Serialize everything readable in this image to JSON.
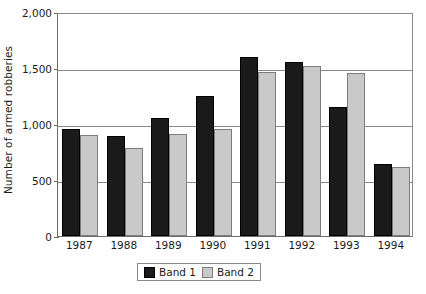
{
  "chart_data": {
    "type": "bar",
    "title": "",
    "xlabel": "",
    "ylabel": "Number of armed robberies",
    "categories": [
      "1987",
      "1988",
      "1989",
      "1990",
      "1991",
      "1992",
      "1993",
      "1994"
    ],
    "series": [
      {
        "name": "Band 1",
        "color": "#1a1a1a",
        "values": [
          955,
          895,
          1055,
          1250,
          1600,
          1555,
          1150,
          645
        ]
      },
      {
        "name": "Band 2",
        "color": "#c9c9c9",
        "values": [
          900,
          790,
          915,
          955,
          1460,
          1520,
          1455,
          615
        ]
      }
    ],
    "ylim": [
      0,
      2000
    ],
    "yticks": [
      0,
      500,
      1000,
      1500,
      2000
    ],
    "ytick_labels": [
      "0",
      "500",
      "1,000",
      "1,500",
      "2,000"
    ],
    "grid": true,
    "legend_position": "bottom-center"
  },
  "axes": {
    "y_title": "Number of armed robberies"
  },
  "legend": {
    "entries": [
      {
        "label": "Band 1"
      },
      {
        "label": "Band 2"
      }
    ]
  }
}
